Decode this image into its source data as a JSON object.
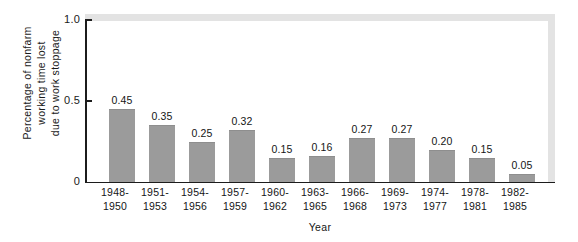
{
  "chart_data": {
    "type": "bar",
    "title": "",
    "xlabel": "Year",
    "ylabel": "Percentage of nonfarm working time lost due to work stoppage",
    "ylabel_lines": [
      "Percentage of nonfarm",
      "working time lost",
      "due to work stoppage"
    ],
    "categories": [
      "1948-1950",
      "1951-1953",
      "1954-1956",
      "1957-1959",
      "1960-1962",
      "1963-1965",
      "1966-1968",
      "1969-1973",
      "1974-1977",
      "1978-1981",
      "1982-1985"
    ],
    "category_lines": [
      [
        "1948-",
        "1950"
      ],
      [
        "1951-",
        "1953"
      ],
      [
        "1954-",
        "1956"
      ],
      [
        "1957-",
        "1959"
      ],
      [
        "1960-",
        "1962"
      ],
      [
        "1963-",
        "1965"
      ],
      [
        "1966-",
        "1968"
      ],
      [
        "1969-",
        "1973"
      ],
      [
        "1974-",
        "1977"
      ],
      [
        "1978-",
        "1981"
      ],
      [
        "1982-",
        "1985"
      ]
    ],
    "values": [
      0.45,
      0.35,
      0.25,
      0.32,
      0.15,
      0.16,
      0.27,
      0.27,
      0.2,
      0.15,
      0.05
    ],
    "value_labels": [
      "0.45",
      "0.35",
      "0.25",
      "0.32",
      "0.15",
      "0.16",
      "0.27",
      "0.27",
      "0.20",
      "0.15",
      "0.05"
    ],
    "ylim": [
      0,
      1.0
    ],
    "yticks": [
      0,
      0.5,
      1.0
    ],
    "ytick_labels": [
      "0",
      "0.5",
      "1.0"
    ],
    "grid": false,
    "legend": null,
    "bar_color": "#9b9b9b",
    "axis_color": "#1c1c1c",
    "frame_color": "#e3e3e3",
    "background": "#ffffff"
  }
}
